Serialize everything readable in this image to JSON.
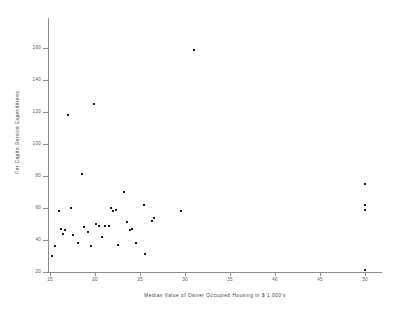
{
  "chart_data": {
    "type": "scatter",
    "title": "",
    "xlabel": "Median Value of Owner Occupied Housing in $ 1,000's",
    "ylabel": "Per Capita Service Expenditures",
    "xlim": [
      13.5,
      51.5
    ],
    "ylim": [
      17,
      170
    ],
    "xticks": [
      15,
      20,
      25,
      30,
      35,
      40,
      45,
      50
    ],
    "yticks": [
      20,
      40,
      60,
      80,
      100,
      120,
      140,
      160
    ],
    "grid": false,
    "legend": null,
    "marker": "dot",
    "marker_color": "#1a1a1a",
    "points": [
      {
        "x": 15.2,
        "y": 30
      },
      {
        "x": 15.6,
        "y": 36
      },
      {
        "x": 16.0,
        "y": 58
      },
      {
        "x": 16.2,
        "y": 47
      },
      {
        "x": 16.4,
        "y": 44
      },
      {
        "x": 16.7,
        "y": 46
      },
      {
        "x": 17.0,
        "y": 118
      },
      {
        "x": 17.3,
        "y": 60
      },
      {
        "x": 17.6,
        "y": 43
      },
      {
        "x": 18.1,
        "y": 38
      },
      {
        "x": 18.6,
        "y": 81
      },
      {
        "x": 18.8,
        "y": 48
      },
      {
        "x": 19.2,
        "y": 45
      },
      {
        "x": 19.5,
        "y": 36
      },
      {
        "x": 19.9,
        "y": 125
      },
      {
        "x": 20.1,
        "y": 50
      },
      {
        "x": 20.4,
        "y": 49
      },
      {
        "x": 20.8,
        "y": 42
      },
      {
        "x": 21.1,
        "y": 49
      },
      {
        "x": 21.5,
        "y": 49
      },
      {
        "x": 21.8,
        "y": 60
      },
      {
        "x": 22.0,
        "y": 58
      },
      {
        "x": 22.3,
        "y": 59
      },
      {
        "x": 22.6,
        "y": 37
      },
      {
        "x": 23.2,
        "y": 70
      },
      {
        "x": 23.6,
        "y": 51
      },
      {
        "x": 23.9,
        "y": 46
      },
      {
        "x": 24.1,
        "y": 47
      },
      {
        "x": 24.6,
        "y": 38
      },
      {
        "x": 25.4,
        "y": 62
      },
      {
        "x": 25.6,
        "y": 31
      },
      {
        "x": 26.3,
        "y": 52
      },
      {
        "x": 26.5,
        "y": 54
      },
      {
        "x": 29.6,
        "y": 58
      },
      {
        "x": 31.0,
        "y": 159
      },
      {
        "x": 50.0,
        "y": 75
      },
      {
        "x": 50.0,
        "y": 62
      },
      {
        "x": 50.0,
        "y": 59
      },
      {
        "x": 50.0,
        "y": 21
      }
    ]
  }
}
